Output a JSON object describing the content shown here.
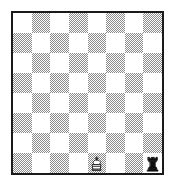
{
  "diagram": {
    "kind": "chess-board-diagram",
    "board_size": 8,
    "orientation": "white-bottom",
    "files": [
      "a",
      "b",
      "c",
      "d",
      "e",
      "f",
      "g",
      "h"
    ],
    "ranks": [
      "8",
      "7",
      "6",
      "5",
      "4",
      "3",
      "2",
      "1"
    ],
    "colors": {
      "light_square": "#ffffff",
      "dark_square": "#8a8a8a",
      "border": "#1a1a1a",
      "background": "#ffffff",
      "piece_outline": "#111111",
      "white_piece_fill": "#ffffff",
      "black_piece_fill": "#111111"
    },
    "squares": [
      [
        "light",
        "dark",
        "light",
        "dark",
        "light",
        "dark",
        "light",
        "dark"
      ],
      [
        "dark",
        "light",
        "dark",
        "light",
        "dark",
        "light",
        "dark",
        "light"
      ],
      [
        "light",
        "dark",
        "light",
        "dark",
        "light",
        "dark",
        "light",
        "dark"
      ],
      [
        "dark",
        "light",
        "dark",
        "light",
        "dark",
        "light",
        "dark",
        "light"
      ],
      [
        "light",
        "dark",
        "light",
        "dark",
        "light",
        "dark",
        "light",
        "dark"
      ],
      [
        "dark",
        "light",
        "dark",
        "light",
        "dark",
        "light",
        "dark",
        "light"
      ],
      [
        "light",
        "dark",
        "light",
        "dark",
        "light",
        "dark",
        "light",
        "dark"
      ],
      [
        "dark",
        "light",
        "dark",
        "light",
        "dark",
        "light",
        "dark",
        "light"
      ]
    ],
    "pieces": [
      {
        "square": "e1",
        "file_index": 4,
        "rank_index": 7,
        "color": "white",
        "type": "king",
        "icon": "white-king-icon",
        "glyph": "♔"
      },
      {
        "square": "h1",
        "file_index": 7,
        "rank_index": 7,
        "color": "black",
        "type": "rook",
        "icon": "black-rook-icon",
        "glyph": "♜"
      }
    ],
    "piece_count": 2
  }
}
